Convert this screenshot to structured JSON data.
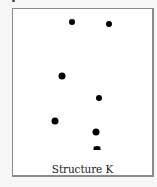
{
  "figure": {
    "caption": "Structure K",
    "frame": {
      "border_color": "#8a8a8a",
      "background": "#ffffff"
    },
    "dots": [
      {
        "x": 59,
        "y": 13,
        "w": 6,
        "h": 6,
        "shape": "circle"
      },
      {
        "x": 96,
        "y": 15,
        "w": 6,
        "h": 6,
        "shape": "circle"
      },
      {
        "x": 49,
        "y": 67,
        "w": 7,
        "h": 7,
        "shape": "circle"
      },
      {
        "x": 86,
        "y": 89,
        "w": 6,
        "h": 6,
        "shape": "circle"
      },
      {
        "x": 42,
        "y": 112,
        "w": 7,
        "h": 7,
        "shape": "circle"
      },
      {
        "x": 83,
        "y": 123,
        "w": 7,
        "h": 7,
        "shape": "circle"
      },
      {
        "x": 84,
        "y": 139,
        "w": 7,
        "h": 4,
        "shape": "half"
      }
    ]
  }
}
